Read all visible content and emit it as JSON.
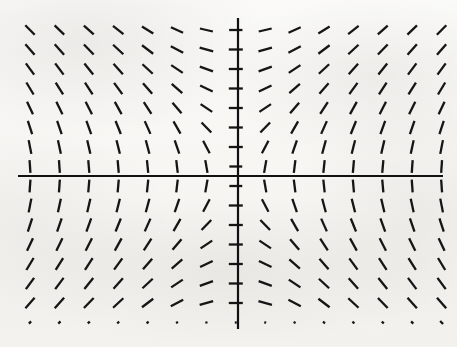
{
  "figure": {
    "kind": "slope-field",
    "width": 457,
    "height": 347,
    "background_color": "#f7f6f3",
    "ink_color": "#111111"
  },
  "axes": {
    "origin_px": {
      "x": 238,
      "y": 176
    },
    "x_axis": {
      "x1": 18,
      "y1": 176,
      "x2": 443,
      "y2": 176,
      "stroke_width": 2.2
    },
    "y_axis": {
      "x1": 238,
      "y1": 18,
      "x2": 238,
      "y2": 329,
      "stroke_width": 2.2
    },
    "tick_labels_x": [],
    "tick_labels_y": [],
    "xlabel": "",
    "ylabel": "",
    "title": ""
  },
  "chart_data": {
    "type": "scatter",
    "title": "",
    "subtitle": "",
    "xlabel": "",
    "ylabel": "",
    "grid": false,
    "legend": [],
    "legend_position": "none",
    "annotations": [],
    "slope_formula": "dy/dx = -x/y",
    "grid_columns": 15,
    "grid_rows": 16,
    "x_start_px": 30,
    "x_step_px": 29.4,
    "y_start_px": 30,
    "y_step_px": 19.5,
    "segment_length_px": 14,
    "segment_stroke_width": 2.3,
    "xlim": [
      -7.5,
      7.0
    ],
    "ylim": [
      -7.6,
      7.6
    ],
    "x": [
      -7.5,
      -6.4,
      -5.4,
      -4.3,
      -3.2,
      -2.1,
      -1.1,
      0.0,
      1.1,
      2.1,
      3.2,
      4.3,
      5.4,
      6.4,
      7.0
    ],
    "y": [
      7.5,
      6.5,
      5.5,
      4.5,
      3.5,
      2.5,
      1.5,
      0.5,
      -0.5,
      -1.5,
      -2.5,
      -3.5,
      -4.5,
      -5.5,
      -6.5,
      -7.5
    ],
    "series": [
      {
        "name": "direction elements",
        "angles_deg_rows": [
          [
            45,
            44,
            42,
            38,
            32,
            24,
            13,
            0,
            -13,
            -24,
            -32,
            -38,
            -42,
            -44,
            -45
          ],
          [
            49,
            48,
            46,
            43,
            37,
            28,
            16,
            0,
            -16,
            -28,
            -37,
            -43,
            -46,
            -48,
            -49
          ],
          [
            54,
            53,
            51,
            48,
            43,
            34,
            20,
            0,
            -20,
            -34,
            -43,
            -48,
            -51,
            -53,
            -54
          ],
          [
            59,
            58,
            57,
            54,
            49,
            41,
            26,
            0,
            -26,
            -41,
            -49,
            -54,
            -57,
            -58,
            -59
          ],
          [
            65,
            64,
            63,
            61,
            57,
            50,
            34,
            0,
            -34,
            -50,
            -57,
            -61,
            -63,
            -64,
            -65
          ],
          [
            72,
            71,
            70,
            68,
            66,
            60,
            46,
            0,
            -46,
            -60,
            -66,
            -68,
            -70,
            -71,
            -72
          ],
          [
            79,
            78,
            77,
            76,
            75,
            71,
            62,
            0,
            -62,
            -71,
            -75,
            -76,
            -77,
            -78,
            -79
          ],
          [
            86,
            86,
            85,
            85,
            84,
            83,
            80,
            0,
            -80,
            -83,
            -84,
            -85,
            -85,
            -86,
            -86
          ],
          [
            -86,
            -86,
            -85,
            -85,
            -84,
            -83,
            -80,
            0,
            80,
            83,
            84,
            85,
            85,
            86,
            86
          ],
          [
            -79,
            -78,
            -77,
            -76,
            -75,
            -71,
            -62,
            0,
            62,
            71,
            75,
            76,
            77,
            78,
            79
          ],
          [
            -72,
            -71,
            -70,
            -68,
            -66,
            -60,
            -46,
            0,
            46,
            60,
            66,
            68,
            70,
            71,
            72
          ],
          [
            -65,
            -64,
            -63,
            -61,
            -57,
            -50,
            -34,
            0,
            34,
            50,
            57,
            61,
            63,
            64,
            65
          ],
          [
            -59,
            -58,
            -57,
            -54,
            -49,
            -41,
            -26,
            0,
            26,
            41,
            49,
            54,
            57,
            58,
            59
          ],
          [
            -54,
            -53,
            -51,
            -48,
            -43,
            -34,
            -20,
            0,
            20,
            34,
            43,
            48,
            51,
            53,
            54
          ],
          [
            -49,
            -48,
            -46,
            -43,
            -37,
            -28,
            -16,
            0,
            16,
            28,
            37,
            43,
            46,
            48,
            49
          ],
          [
            -45,
            -44,
            -42,
            -38,
            -32,
            -24,
            -13,
            0,
            13,
            24,
            32,
            38,
            42,
            44,
            45
          ]
        ],
        "length_scale_rows": [
          [
            0.95,
            0.95,
            0.95,
            0.95,
            0.95,
            0.95,
            0.95,
            0.95,
            0.95,
            0.95,
            0.95,
            0.95,
            0.95,
            0.95,
            0.95
          ],
          [
            1.0,
            1.0,
            1.0,
            1.0,
            1.0,
            1.0,
            1.0,
            1.0,
            1.0,
            1.0,
            1.0,
            1.0,
            1.0,
            1.0,
            1.0
          ],
          [
            1.0,
            1.0,
            1.0,
            1.0,
            1.0,
            1.0,
            1.0,
            1.0,
            1.0,
            1.0,
            1.0,
            1.0,
            1.0,
            1.0,
            1.0
          ],
          [
            1.0,
            1.0,
            1.0,
            1.0,
            1.0,
            1.0,
            1.0,
            1.0,
            1.0,
            1.0,
            1.0,
            1.0,
            1.0,
            1.0,
            1.0
          ],
          [
            1.0,
            1.0,
            1.0,
            1.0,
            1.0,
            1.0,
            1.0,
            1.0,
            1.0,
            1.0,
            1.0,
            1.0,
            1.0,
            1.0,
            1.0
          ],
          [
            1.0,
            1.0,
            1.0,
            1.0,
            1.0,
            1.0,
            1.0,
            1.0,
            1.0,
            1.0,
            1.0,
            1.0,
            1.0,
            1.0,
            1.0
          ],
          [
            1.0,
            1.0,
            1.0,
            1.0,
            1.0,
            1.0,
            1.0,
            1.0,
            1.0,
            1.0,
            1.0,
            1.0,
            1.0,
            1.0,
            1.0
          ],
          [
            0.92,
            0.92,
            0.92,
            0.92,
            0.92,
            0.92,
            0.92,
            0.92,
            0.92,
            0.92,
            0.92,
            0.92,
            0.92,
            0.92,
            0.92
          ],
          [
            0.92,
            0.92,
            0.92,
            0.92,
            0.92,
            0.92,
            0.92,
            0.92,
            0.92,
            0.92,
            0.92,
            0.92,
            0.92,
            0.92,
            0.92
          ],
          [
            1.0,
            1.0,
            1.0,
            1.0,
            1.0,
            1.0,
            1.0,
            1.0,
            1.0,
            1.0,
            1.0,
            1.0,
            1.0,
            1.0,
            1.0
          ],
          [
            1.0,
            1.0,
            1.0,
            1.0,
            1.0,
            1.0,
            1.0,
            1.0,
            1.0,
            1.0,
            1.0,
            1.0,
            1.0,
            1.0,
            1.0
          ],
          [
            1.0,
            1.0,
            1.0,
            1.0,
            1.0,
            1.0,
            1.0,
            1.0,
            1.0,
            1.0,
            1.0,
            1.0,
            1.0,
            1.0,
            1.0
          ],
          [
            1.0,
            1.0,
            1.0,
            1.0,
            1.0,
            1.0,
            1.0,
            1.0,
            1.0,
            1.0,
            1.0,
            1.0,
            1.0,
            1.0,
            1.0
          ],
          [
            1.0,
            1.0,
            1.0,
            1.0,
            1.0,
            1.0,
            1.0,
            1.0,
            1.0,
            1.0,
            1.0,
            1.0,
            1.0,
            1.0,
            1.0
          ],
          [
            1.0,
            1.0,
            1.0,
            1.0,
            1.0,
            1.0,
            1.0,
            1.0,
            1.0,
            1.0,
            1.0,
            1.0,
            1.0,
            1.0,
            1.0
          ],
          [
            0.22,
            0.22,
            0.2,
            0.18,
            0.18,
            0.16,
            0.16,
            0.14,
            0.14,
            0.16,
            0.18,
            0.18,
            0.2,
            0.22,
            0.3
          ]
        ]
      }
    ]
  }
}
